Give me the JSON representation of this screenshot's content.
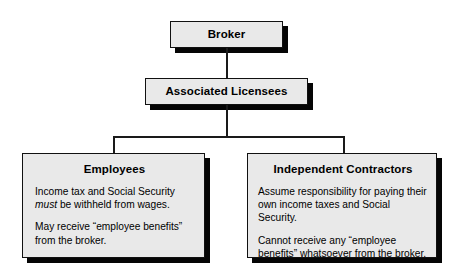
{
  "diagram": {
    "type": "hierarchy-flowchart",
    "background_color": "#ffffff",
    "node_fill_color": "#e9e9e9",
    "node_border_color": "#111111",
    "shadow_color": "#050505",
    "text_color": "#000000",
    "nodes": {
      "broker": {
        "title": "Broker"
      },
      "licensees": {
        "title": "Associated Licensees"
      },
      "employees": {
        "title": "Employees",
        "para1_before_italic": "Income tax and Social Security ",
        "para1_italic": "must",
        "para1_after_italic": " be withheld from wages.",
        "para2": "May receive “employee benefits” from the broker."
      },
      "contractors": {
        "title": "Independent Contractors",
        "para1": "Assume responsibility for paying their own income taxes and Social Security.",
        "para2": "Cannot receive any “employee benefits” whatsoever from the broker."
      }
    }
  }
}
